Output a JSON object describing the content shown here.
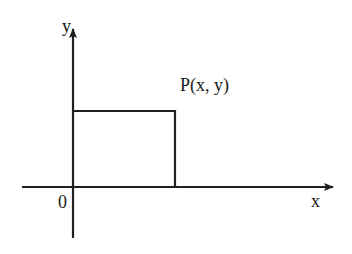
{
  "diagram": {
    "axes": {
      "x_label": "x",
      "y_label": "y",
      "origin_label": "0"
    },
    "point": {
      "label": "P(x, y)"
    },
    "colors": {
      "line": "#1f1f1f",
      "background": "#ffffff",
      "bleed_text": "#ececec"
    }
  }
}
